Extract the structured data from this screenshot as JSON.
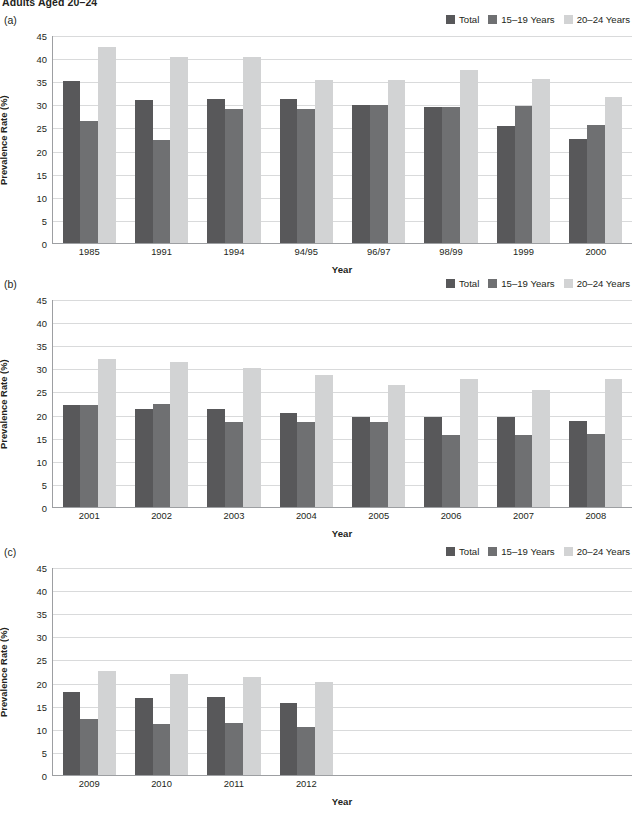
{
  "document": {
    "title": "Adults Aged 20–24"
  },
  "panels": [
    {
      "letter": "(a)"
    },
    {
      "letter": "(b)"
    },
    {
      "letter": "(c)"
    }
  ],
  "legend": {
    "items": [
      {
        "label": "Total",
        "color": "#58585a"
      },
      {
        "label": "15–19 Years",
        "color": "#6f7072"
      },
      {
        "label": "20–24 Years",
        "color": "#d2d3d4"
      }
    ]
  },
  "axis": {
    "ylabel": "Prevalence Rate (%)",
    "xlabel": "Year",
    "yticks": [
      0,
      5,
      10,
      15,
      20,
      25,
      30,
      35,
      40,
      45
    ]
  },
  "chart_data": [
    {
      "type": "bar",
      "panel": "(a)",
      "title": "Adults Aged 20–24",
      "xlabel": "Year",
      "ylabel": "Prevalence Rate (%)",
      "ylim": [
        0,
        45
      ],
      "ytick_step": 5,
      "grid": true,
      "legend_position": "top-right",
      "slots": 8,
      "categories": [
        "1985",
        "1991",
        "1994",
        "94/95",
        "96/97",
        "98/99",
        "1999",
        "2000"
      ],
      "series": [
        {
          "name": "Total",
          "color": "#58585a",
          "values": [
            35.0,
            31.0,
            31.2,
            31.2,
            29.8,
            29.5,
            25.4,
            22.4
          ]
        },
        {
          "name": "15–19 Years",
          "color": "#6f7072",
          "values": [
            26.5,
            22.2,
            29.0,
            29.1,
            29.9,
            29.5,
            29.7,
            25.6
          ]
        },
        {
          "name": "20–24 Years",
          "color": "#d2d3d4",
          "values": [
            42.5,
            40.2,
            40.2,
            35.3,
            35.3,
            37.5,
            35.4,
            31.6
          ]
        }
      ]
    },
    {
      "type": "bar",
      "panel": "(b)",
      "xlabel": "Year",
      "ylabel": "Prevalence Rate (%)",
      "ylim": [
        0,
        45
      ],
      "ytick_step": 5,
      "grid": true,
      "legend_position": "top-right",
      "slots": 8,
      "categories": [
        "2001",
        "2002",
        "2003",
        "2004",
        "2005",
        "2006",
        "2007",
        "2008"
      ],
      "series": [
        {
          "name": "Total",
          "color": "#58585a",
          "values": [
            22.1,
            21.2,
            21.3,
            20.3,
            19.4,
            19.5,
            19.4,
            18.7
          ]
        },
        {
          "name": "15–19 Years",
          "color": "#6f7072",
          "values": [
            22.1,
            22.3,
            18.3,
            18.4,
            18.4,
            15.5,
            15.6,
            15.8
          ]
        },
        {
          "name": "20–24 Years",
          "color": "#d2d3d4",
          "values": [
            32.1,
            31.4,
            30.1,
            28.5,
            26.5,
            27.6,
            25.4,
            27.7
          ]
        }
      ]
    },
    {
      "type": "bar",
      "panel": "(c)",
      "xlabel": "Year",
      "ylabel": "Prevalence Rate (%)",
      "ylim": [
        0,
        45
      ],
      "ytick_step": 5,
      "grid": true,
      "legend_position": "top-right",
      "slots": 8,
      "categories": [
        "2009",
        "2010",
        "2011",
        "2012"
      ],
      "series": [
        {
          "name": "Total",
          "color": "#58585a",
          "values": [
            18.0,
            16.7,
            16.9,
            15.5
          ]
        },
        {
          "name": "15–19 Years",
          "color": "#6f7072",
          "values": [
            12.1,
            11.0,
            11.2,
            10.3
          ]
        },
        {
          "name": "20–24 Years",
          "color": "#d2d3d4",
          "values": [
            22.4,
            21.8,
            21.2,
            20.2
          ]
        }
      ]
    }
  ]
}
